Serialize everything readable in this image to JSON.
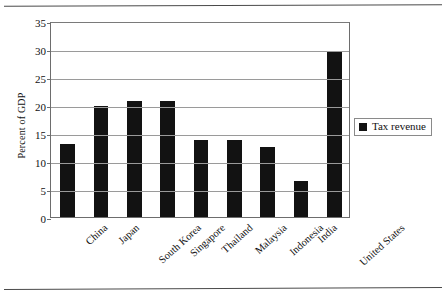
{
  "chart_data": {
    "type": "bar",
    "title": "",
    "xlabel": "",
    "ylabel": "Percent of GDP",
    "ylim": [
      0,
      35
    ],
    "ytick_step": 5,
    "yticks": [
      "0",
      "5",
      "10",
      "15",
      "20",
      "25",
      "30",
      "35"
    ],
    "grid": true,
    "legend_position": "right",
    "series_color": "#121212",
    "categories": [
      "China",
      "Japan",
      "South Korea",
      "Singapore",
      "Thailand",
      "Malaysia",
      "Indonesia",
      "India",
      "United States"
    ],
    "series": [
      {
        "name": "Tax revenue",
        "values": [
          13.0,
          19.9,
          20.8,
          20.8,
          13.8,
          13.8,
          12.5,
          6.5,
          29.5
        ]
      }
    ]
  },
  "legend": {
    "entries": [
      {
        "label": "Tax revenue",
        "swatch": "legend-swatch-black"
      }
    ]
  },
  "axes": {
    "y_title": "Percent of GDP"
  }
}
